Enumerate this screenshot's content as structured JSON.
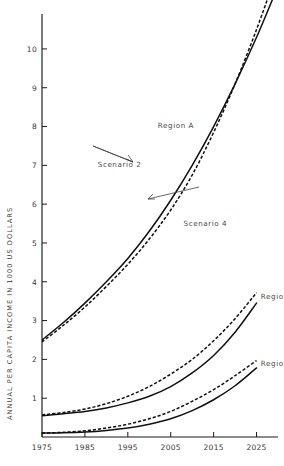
{
  "chart_data": {
    "type": "line",
    "title": "",
    "xlabel": "",
    "ylabel": "ANNUAL PER CAPITA INCOME IN 1000 US DOLLARS",
    "xlim": [
      1975,
      2030
    ],
    "ylim": [
      0,
      10.9
    ],
    "grid": false,
    "legend_position": "inline-annotations",
    "xticks": [
      1975,
      1985,
      1995,
      2005,
      2015,
      2025
    ],
    "xtick_labels": [
      "1975",
      "1985",
      "1995",
      "2005",
      "2015",
      "2025"
    ],
    "yticks": [
      1,
      2,
      3,
      4,
      5,
      6,
      7,
      8,
      9,
      10
    ],
    "ytick_labels": [
      "1",
      "2",
      "3",
      "4",
      "5",
      "6",
      "7",
      "8",
      "9",
      "10"
    ],
    "annotations": [
      {
        "text": "Region A",
        "x": 2002,
        "y": 7.95
      },
      {
        "text": "Scenario 2",
        "x": 1988,
        "y": 6.95
      },
      {
        "text": "Scenario 4",
        "x": 2008,
        "y": 5.45
      },
      {
        "text": "Region 6",
        "x": 2026,
        "y": 3.55
      },
      {
        "text": "Region 9",
        "x": 2026,
        "y": 1.82
      }
    ],
    "series": [
      {
        "name": "Region A - Scenario 2",
        "style": "solid",
        "region": "Region A",
        "scenario": "Scenario 2",
        "x": [
          1975,
          1980,
          1985,
          1990,
          1995,
          2000,
          2005,
          2010,
          2015,
          2020,
          2025,
          2029
        ],
        "values": [
          2.5,
          2.95,
          3.45,
          4.0,
          4.6,
          5.3,
          6.1,
          7.0,
          8.0,
          9.1,
          10.3,
          11.35
        ]
      },
      {
        "name": "Region A - Scenario 4",
        "style": "dashed",
        "region": "Region A",
        "scenario": "Scenario 4",
        "x": [
          1975,
          1980,
          1985,
          1990,
          1995,
          2000,
          2005,
          2010,
          2015,
          2020,
          2025,
          2029
        ],
        "values": [
          2.45,
          2.88,
          3.35,
          3.88,
          4.45,
          5.1,
          5.85,
          6.75,
          7.85,
          9.1,
          10.5,
          11.75
        ]
      },
      {
        "name": "Region 6 - Scenario 4",
        "style": "dashed",
        "region": "Region 6",
        "scenario": "Scenario 4",
        "x": [
          1975,
          1980,
          1985,
          1990,
          1995,
          2000,
          2005,
          2010,
          2015,
          2020,
          2025
        ],
        "values": [
          0.57,
          0.63,
          0.72,
          0.86,
          1.05,
          1.3,
          1.62,
          2.0,
          2.48,
          3.05,
          3.72
        ]
      },
      {
        "name": "Region 6 - Scenario 2",
        "style": "solid",
        "region": "Region 6",
        "scenario": "Scenario 2",
        "x": [
          1975,
          1980,
          1985,
          1990,
          1995,
          2000,
          2005,
          2010,
          2015,
          2020,
          2025
        ],
        "values": [
          0.55,
          0.6,
          0.66,
          0.75,
          0.88,
          1.05,
          1.3,
          1.65,
          2.1,
          2.7,
          3.45
        ]
      },
      {
        "name": "Region 9 - Scenario 4",
        "style": "dashed",
        "region": "Region 9",
        "scenario": "Scenario 4",
        "x": [
          1975,
          1980,
          1985,
          1990,
          1995,
          2000,
          2005,
          2010,
          2015,
          2020,
          2025
        ],
        "values": [
          0.1,
          0.12,
          0.16,
          0.23,
          0.33,
          0.47,
          0.66,
          0.92,
          1.22,
          1.58,
          1.97
        ]
      },
      {
        "name": "Region 9 - Scenario 2",
        "style": "solid",
        "region": "Region 9",
        "scenario": "Scenario 2",
        "x": [
          1975,
          1980,
          1985,
          1990,
          1995,
          2000,
          2005,
          2010,
          2015,
          2020,
          2025
        ],
        "values": [
          0.1,
          0.11,
          0.13,
          0.17,
          0.23,
          0.33,
          0.47,
          0.68,
          0.96,
          1.32,
          1.78
        ]
      }
    ],
    "colors": {
      "axis": "#1a1a1a",
      "curve": "#101010",
      "text": "#3a3a3a",
      "background": "#ffffff"
    }
  }
}
